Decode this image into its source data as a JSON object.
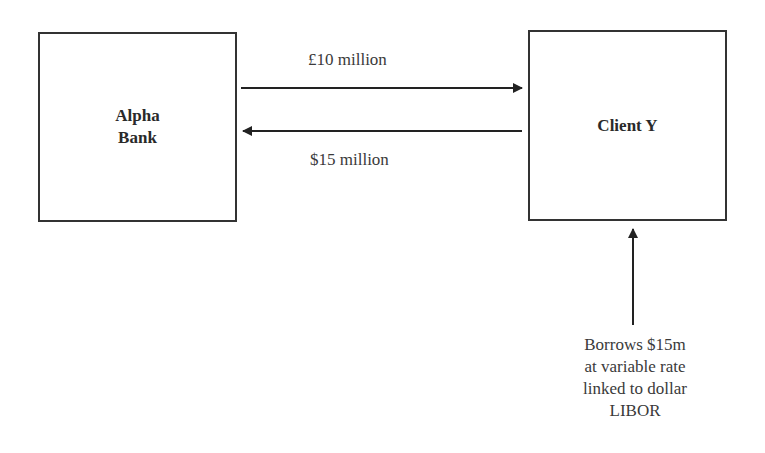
{
  "diagram": {
    "nodes": [
      {
        "id": "alpha",
        "label_line1": "Alpha",
        "label_line2": "Bank"
      },
      {
        "id": "client",
        "label": "Client Y"
      }
    ],
    "edges": [
      {
        "from": "alpha",
        "to": "client",
        "label": "£10 million"
      },
      {
        "from": "client",
        "to": "alpha",
        "label": "$15 million"
      }
    ],
    "annotation": {
      "lines": [
        "Borrows $15m",
        "at variable rate",
        "linked to dollar",
        "LIBOR"
      ]
    }
  }
}
